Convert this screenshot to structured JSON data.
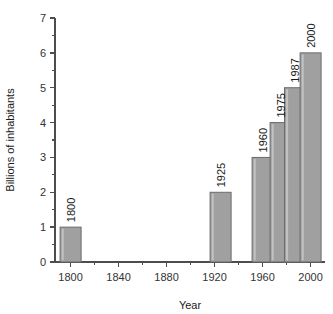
{
  "chart_data": {
    "type": "bar",
    "title": "",
    "xlabel": "Year",
    "ylabel": "Billions of inhabitants",
    "categories": [
      "1800",
      "1925",
      "1960",
      "1975",
      "1987",
      "2000"
    ],
    "values": [
      1,
      2,
      3,
      4,
      5,
      6
    ],
    "bar_labels": [
      "1800",
      "1925",
      "1960",
      "1975",
      "1987",
      "2000"
    ],
    "x_values": [
      1800,
      1925,
      1960,
      1975,
      1987,
      2000
    ],
    "xlim": [
      1787,
      2012
    ],
    "ylim": [
      0,
      7
    ],
    "x_ticks_major": [
      1800,
      1840,
      1880,
      1920,
      1960,
      2000
    ],
    "x_tick_labels": [
      "1800",
      "1840",
      "1880",
      "1920",
      "1960",
      "2000"
    ],
    "x_ticks_minor": [
      1820,
      1860,
      1900,
      1940,
      1980
    ],
    "y_ticks_major": [
      0,
      1,
      2,
      3,
      4,
      5,
      6,
      7
    ],
    "y_tick_labels": [
      "0",
      "1",
      "2",
      "3",
      "4",
      "5",
      "6",
      "7"
    ],
    "y_ticks_minor": [
      0.5,
      1.5,
      2.5,
      3.5,
      4.5,
      5.5,
      6.5
    ],
    "grid": false,
    "legend": "none",
    "bar_color": "#a0a0a0",
    "bar_edge_color": "#6b6b6b",
    "axis_color": "#4d4d4d",
    "background": "#ffffff",
    "bar_label_rotation": -90
  },
  "figure": {
    "plot_left_px": 55,
    "plot_right_px": 325,
    "plot_top_px": 18,
    "plot_bottom_px": 262,
    "bar_width_px": 21
  }
}
